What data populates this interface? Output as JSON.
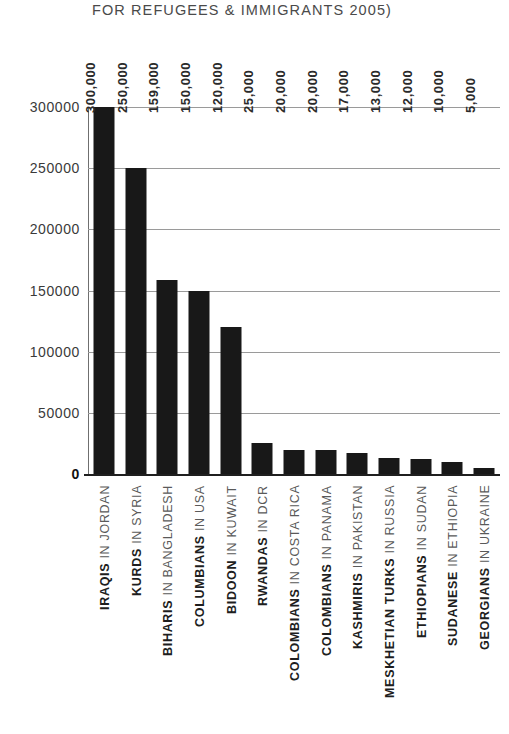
{
  "chart_data": {
    "type": "bar",
    "title": "FOR REFUGEES & IMMIGRANTS 2005)",
    "xlabel": "",
    "ylabel": "",
    "ylim": [
      0,
      300000
    ],
    "grid": true,
    "legend": "none",
    "orientation": "vertical",
    "bar_color": "#181818",
    "gridline_color": "#9a9a9a",
    "y_ticks": [
      300000,
      250000,
      200000,
      150000,
      100000,
      50000,
      0
    ],
    "y_tick_labels": [
      "300000",
      "250000",
      "200000",
      "150000",
      "100000",
      "50000",
      "0"
    ],
    "categories": [
      "IRAQIS IN JORDAN",
      "KURDS IN SYRIA",
      "BIHARIS IN BANGLADESH",
      "COLUMBIANS IN USA",
      "BIDOON IN KUWAIT",
      "RWANDAS IN DCR",
      "COLOMBIANS IN COSTA RICA",
      "COLOMBIANS IN PANAMA",
      "KASHMIRIS IN PAKISTAN",
      "MESKHETIAN TURKS IN RUSSIA",
      "ETHIOPIANS IN SUDAN",
      "SUDANESE IN ETHIOPIA",
      "GEORGIANS IN UKRAINE"
    ],
    "category_parts": [
      {
        "group": "IRAQIS",
        "place": "IN JORDAN"
      },
      {
        "group": "KURDS",
        "place": "IN SYRIA"
      },
      {
        "group": "BIHARIS",
        "place": "IN BANGLADESH"
      },
      {
        "group": "COLUMBIANS",
        "place": "IN USA"
      },
      {
        "group": "BIDOON",
        "place": "IN KUWAIT"
      },
      {
        "group": "RWANDAS",
        "place": "IN DCR"
      },
      {
        "group": "COLOMBIANS",
        "place": "IN COSTA RICA"
      },
      {
        "group": "COLOMBIANS",
        "place": "IN PANAMA"
      },
      {
        "group": "KASHMIRIS",
        "place": "IN PAKISTAN"
      },
      {
        "group": "MESKHETIAN TURKS",
        "place": "IN RUSSIA"
      },
      {
        "group": "ETHIOPIANS",
        "place": "IN SUDAN"
      },
      {
        "group": "SUDANESE",
        "place": "IN ETHIOPIA"
      },
      {
        "group": "GEORGIANS",
        "place": "IN UKRAINE"
      }
    ],
    "values": [
      300000,
      250000,
      159000,
      150000,
      120000,
      25000,
      20000,
      20000,
      17000,
      13000,
      12000,
      10000,
      5000
    ],
    "value_labels": [
      "300,000",
      "250,000",
      "159,000",
      "150,000",
      "120,000",
      "25,000",
      "20,000",
      "20,000",
      "17,000",
      "13,000",
      "12,000",
      "10,000",
      "5,000"
    ]
  }
}
